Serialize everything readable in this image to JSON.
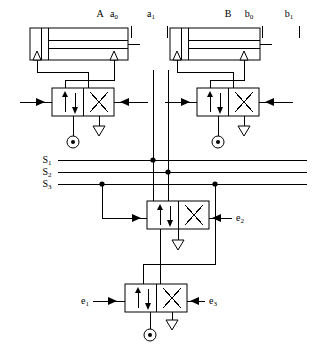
{
  "diagram": {
    "type": "pneumatic-circuit-schematic",
    "width": 313,
    "height": 344,
    "background_color": "#ffffff",
    "line_color": "#000000"
  },
  "cylinders": [
    {
      "id": "cylinder-a",
      "label": "A",
      "label_x": 100,
      "label_y": 17,
      "sensors": [
        {
          "name": "a0",
          "base": "a",
          "sub": "0",
          "x": 114,
          "y": 17,
          "tick_x": 131,
          "tick_y_top": 26,
          "tick_y_bottom": 38
        },
        {
          "name": "a1",
          "base": "a",
          "sub": "1",
          "x": 151,
          "y": 17,
          "tick_x": 167,
          "tick_y_top": 26,
          "tick_y_bottom": 38
        }
      ],
      "body": {
        "x": 30,
        "y": 28,
        "w": 98,
        "h": 32
      }
    },
    {
      "id": "cylinder-b",
      "label": "B",
      "label_x": 228,
      "label_y": 17,
      "sensors": [
        {
          "name": "b0",
          "base": "b",
          "sub": "0",
          "x": 249,
          "y": 17,
          "tick_x": 262,
          "tick_y_top": 26,
          "tick_y_bottom": 38
        },
        {
          "name": "b1",
          "base": "b",
          "sub": "1",
          "x": 289,
          "y": 17,
          "tick_x": 299,
          "tick_y_top": 26,
          "tick_y_bottom": 38
        }
      ],
      "body": {
        "x": 170,
        "y": 28,
        "w": 90,
        "h": 32
      }
    }
  ],
  "valves": [
    {
      "id": "valve-a",
      "name": "master-valve-a",
      "kind": "5/2-way directional control valve",
      "x": 52,
      "y": 88,
      "w": 62,
      "h": 28,
      "has_pressure_source": true,
      "has_exhaust": true
    },
    {
      "id": "valve-b",
      "name": "master-valve-b",
      "kind": "5/2-way directional control valve",
      "x": 197,
      "y": 88,
      "w": 62,
      "h": 28,
      "has_pressure_source": true,
      "has_exhaust": true
    },
    {
      "id": "valve-cascade-upper",
      "name": "cascade-valve-upper",
      "kind": "4/2-way directional control valve",
      "x": 147,
      "y": 201,
      "w": 62,
      "h": 28,
      "has_pressure_source": false,
      "has_exhaust": true,
      "right_signal": {
        "name": "e2",
        "base": "e",
        "sub": "2",
        "label_x": 237,
        "label_y": 218
      }
    },
    {
      "id": "valve-cascade-lower",
      "name": "cascade-valve-lower",
      "kind": "4/2-way directional control valve",
      "x": 125,
      "y": 284,
      "w": 62,
      "h": 28,
      "has_pressure_source": true,
      "has_exhaust": true,
      "left_signal": {
        "name": "e1",
        "base": "e",
        "sub": "1",
        "label_x": 82,
        "label_y": 301
      },
      "right_signal": {
        "name": "e3",
        "base": "e",
        "sub": "3",
        "label_x": 210,
        "label_y": 301
      }
    }
  ],
  "signal_lines": [
    {
      "name": "S1",
      "base": "S",
      "sub": "1",
      "label_x": 47,
      "label_y": 163,
      "y": 160,
      "x_start": 58,
      "x_end": 307,
      "junctions": [
        {
          "x": 153,
          "y": 160
        }
      ]
    },
    {
      "name": "S2",
      "base": "S",
      "sub": "2",
      "label_x": 47,
      "label_y": 175,
      "y": 172,
      "x_start": 58,
      "x_end": 307,
      "junctions": [
        {
          "x": 168,
          "y": 172
        }
      ]
    },
    {
      "name": "S3",
      "base": "S",
      "sub": "3",
      "label_x": 47,
      "label_y": 187,
      "y": 184,
      "x_start": 58,
      "x_end": 307,
      "junctions": [
        {
          "x": 102,
          "y": 184
        },
        {
          "x": 215,
          "y": 184
        }
      ]
    }
  ],
  "symbols": {
    "pressure_source": "circle-with-dot",
    "exhaust": "open-triangle",
    "flow_arrow": "filled-triangle",
    "junction": "filled-dot",
    "spring": "zigzag",
    "pilot_arrow": "arrow"
  },
  "legend_notes": {
    "cylinder_label_a": "A",
    "cylinder_label_b": "B",
    "signal_prefix": "S",
    "emitter_prefix": "e"
  }
}
